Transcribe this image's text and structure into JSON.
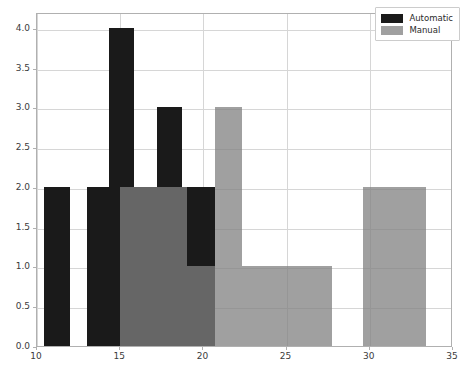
{
  "chart_data": {
    "type": "bar",
    "chart_kind": "histogram-overlay",
    "title": "",
    "xlabel": "",
    "ylabel": "",
    "xlim": [
      10,
      35
    ],
    "ylim": [
      0.0,
      4.2
    ],
    "xticks": [
      "10",
      "15",
      "20",
      "25",
      "30",
      "35"
    ],
    "xtick_values": [
      10,
      15,
      20,
      25,
      30,
      35
    ],
    "yticks": [
      "0.0",
      "0.5",
      "1.0",
      "1.5",
      "2.0",
      "2.5",
      "3.0",
      "3.5",
      "4.0"
    ],
    "ytick_values": [
      0.0,
      0.5,
      1.0,
      1.5,
      2.0,
      2.5,
      3.0,
      3.5,
      4.0
    ],
    "grid": true,
    "legend_position": "upper right",
    "series": [
      {
        "name": "Automatic",
        "color": "#1a1a1a",
        "bins": [
          {
            "start": 10.4,
            "end": 12.0,
            "value": 2
          },
          {
            "start": 13.0,
            "end": 14.3,
            "value": 2
          },
          {
            "start": 14.3,
            "end": 15.8,
            "value": 4
          },
          {
            "start": 15.8,
            "end": 17.2,
            "value": 2
          },
          {
            "start": 17.2,
            "end": 18.7,
            "value": 3
          },
          {
            "start": 18.7,
            "end": 20.7,
            "value": 2
          }
        ],
        "values": [
          2,
          2,
          4,
          2,
          3,
          2
        ]
      },
      {
        "name": "Manual",
        "color": "#808080",
        "bins": [
          {
            "start": 15.0,
            "end": 19.0,
            "value": 2
          },
          {
            "start": 19.0,
            "end": 20.7,
            "value": 1
          },
          {
            "start": 20.7,
            "end": 22.3,
            "value": 3
          },
          {
            "start": 22.3,
            "end": 24.4,
            "value": 1
          },
          {
            "start": 24.4,
            "end": 27.7,
            "value": 1
          },
          {
            "start": 29.6,
            "end": 33.4,
            "value": 2
          }
        ],
        "values": [
          2,
          1,
          3,
          1,
          1,
          2
        ]
      }
    ]
  },
  "legend": {
    "entries": [
      {
        "label": "Automatic",
        "swatch": "auto"
      },
      {
        "label": "Manual",
        "swatch": "man"
      }
    ]
  }
}
